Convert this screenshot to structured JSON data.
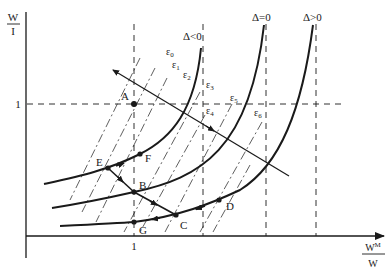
{
  "axes": {
    "y_label_num": "W",
    "y_label_den": "I",
    "x_label_num": "W",
    "x_label_sup": "M",
    "x_label_den": "W",
    "y_tick": "1",
    "x_tick": "1"
  },
  "curves": [
    {
      "id": "delta-neg",
      "label": "Δ<0"
    },
    {
      "id": "delta-zero",
      "label": "Δ=0"
    },
    {
      "id": "delta-pos",
      "label": "Δ>0"
    }
  ],
  "epsilons": [
    "ε0",
    "ε1",
    "ε2",
    "ε3",
    "ε4",
    "ε5",
    "ε6"
  ],
  "epsilon_labels": {
    "e0": {
      "base": "ε",
      "sub": "0"
    },
    "e1": {
      "base": "ε",
      "sub": "1"
    },
    "e2": {
      "base": "ε",
      "sub": "2"
    },
    "e3": {
      "base": "ε",
      "sub": "3"
    },
    "e4": {
      "base": "ε",
      "sub": "4"
    },
    "e5": {
      "base": "ε",
      "sub": "5"
    },
    "e6": {
      "base": "ε",
      "sub": "6"
    }
  },
  "points": {
    "A": "A",
    "B": "B",
    "C": "C",
    "D": "D",
    "E": "E",
    "F": "F",
    "G": "G"
  },
  "colors": {
    "ink": "#1a1a1a",
    "background": "#ffffff"
  }
}
